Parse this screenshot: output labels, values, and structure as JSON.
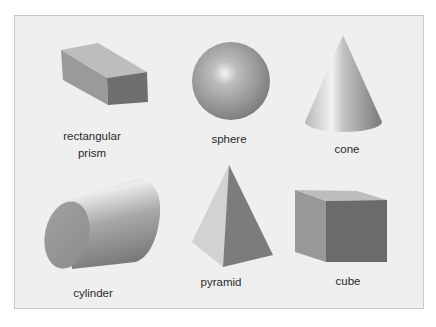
{
  "figure": {
    "background": "#efefef",
    "border": "#c9c9c9",
    "shapes": [
      {
        "id": "rectangular-prism",
        "label_line1": "rectangular",
        "label_line2": "prism"
      },
      {
        "id": "sphere",
        "label": "sphere"
      },
      {
        "id": "cone",
        "label": "cone"
      },
      {
        "id": "cylinder",
        "label": "cylinder"
      },
      {
        "id": "pyramid",
        "label": "pyramid"
      },
      {
        "id": "cube",
        "label": "cube"
      }
    ]
  }
}
